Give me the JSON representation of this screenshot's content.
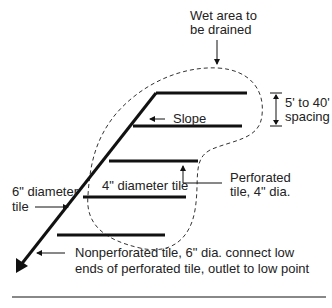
{
  "diagram": {
    "labels": {
      "wet_area_line1": "Wet area to",
      "wet_area_line2": "be drained",
      "spacing_line1": "5' to 40'",
      "spacing_line2": "spacing",
      "slope": "Slope",
      "perforated_line1": "Perforated",
      "perforated_line2": "tile, 4\" dia.",
      "four_inch": "4\" diameter tile",
      "six_inch_line1": "6\" diameter",
      "six_inch_line2": "tile",
      "nonperf_line1": "Nonperforated tile, 6\" dia. connect low",
      "nonperf_line2": "ends of perforated tile, outlet to low point"
    },
    "colors": {
      "line": "#111111",
      "text": "#222222",
      "rule": "#888888"
    }
  }
}
